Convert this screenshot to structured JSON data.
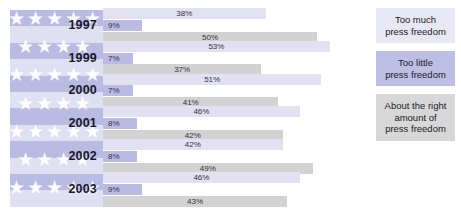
{
  "chart_data": {
    "type": "bar",
    "title": "",
    "xlabel": "",
    "ylabel": "",
    "orientation": "horizontal",
    "grid": false,
    "xlim": [
      0,
      60
    ],
    "legend_position": "right",
    "categories": [
      "1997",
      "1999",
      "2000",
      "2001",
      "2002",
      "2003"
    ],
    "series": [
      {
        "name": "Too much press freedom",
        "color": "#e1e1f2",
        "values": [
          38,
          53,
          51,
          46,
          42,
          46
        ]
      },
      {
        "name": "Too little press freedom",
        "color": "#b9bbe2",
        "values": [
          9,
          7,
          7,
          8,
          8,
          9
        ]
      },
      {
        "name": "About the right amount of press freedom",
        "color": "#d2d2d2",
        "values": [
          50,
          37,
          41,
          42,
          49,
          43
        ]
      }
    ],
    "value_labels": [
      [
        "38%",
        "9%",
        "50%"
      ],
      [
        "53%",
        "7%",
        "37%"
      ],
      [
        "51%",
        "7%",
        "41%"
      ],
      [
        "46%",
        "8%",
        "42%"
      ],
      [
        "42%",
        "8%",
        "49%"
      ],
      [
        "46%",
        "9%",
        "43%"
      ]
    ]
  },
  "years": [
    {
      "label": "1997",
      "toomuch": "38%",
      "toolittle": "9%",
      "aboutright": "50%"
    },
    {
      "label": "1999",
      "toomuch": "53%",
      "toolittle": "7%",
      "aboutright": "37%"
    },
    {
      "label": "2000",
      "toomuch": "51%",
      "toolittle": "7%",
      "aboutright": "41%"
    },
    {
      "label": "2001",
      "toomuch": "46%",
      "toolittle": "8%",
      "aboutright": "42%"
    },
    {
      "label": "2002",
      "toomuch": "42%",
      "toolittle": "8%",
      "aboutright": "49%"
    },
    {
      "label": "2003",
      "toomuch": "46%",
      "toolittle": "9%",
      "aboutright": "43%"
    }
  ],
  "legend": {
    "items": [
      {
        "label": "Too much\npress freedom",
        "line1": "Too much",
        "line2": "press freedom",
        "color": "#e8e8f5"
      },
      {
        "label": "Too little\npress freedom",
        "line1": "Too little",
        "line2": "press freedom",
        "color": "#bcbee3"
      },
      {
        "label": "About the right amount of press freedom",
        "line1": "About the right",
        "line2": "amount of",
        "line3": "press freedom",
        "color": "#d7d7d7"
      }
    ]
  },
  "flag": {
    "name": "us-flag-graphic",
    "field_color": "#b9bbe2",
    "star_color": "#ffffff",
    "stripe_color": "#ffffff"
  }
}
